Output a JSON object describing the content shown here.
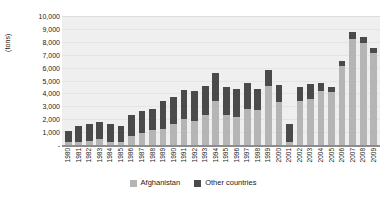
{
  "chart_data": {
    "type": "bar",
    "stacked": true,
    "title": "",
    "subtitle": "",
    "xlabel": "",
    "ylabel": "(tons)",
    "ylim": [
      0,
      10000
    ],
    "ytick_labels": [
      "-",
      "1,000",
      "2,000",
      "3,000",
      "4,000",
      "5,000",
      "6,000",
      "7,000",
      "8,000",
      "9,000",
      "10,000"
    ],
    "ytick_values": [
      0,
      1000,
      2000,
      3000,
      4000,
      5000,
      6000,
      7000,
      8000,
      9000,
      10000
    ],
    "grid": true,
    "legend_position": "bottom",
    "categories": [
      "1980",
      "1981",
      "1982",
      "1983",
      "1984",
      "1985",
      "1986",
      "1987",
      "1988",
      "1989",
      "1990",
      "1991",
      "1992",
      "1993",
      "1994",
      "1995",
      "1996",
      "1997",
      "1998",
      "1999",
      "2000",
      "2001",
      "2002",
      "2003",
      "2004",
      "2005",
      "2006",
      "2007",
      "2008",
      "2009"
    ],
    "series": [
      {
        "name": "Afghanistan",
        "color": "#b5b5b5",
        "values": [
          200,
          200,
          300,
          500,
          250,
          200,
          700,
          900,
          1200,
          1250,
          1600,
          2000,
          1900,
          2300,
          3400,
          2300,
          2200,
          2800,
          2700,
          4600,
          3300,
          200,
          3400,
          3600,
          4200,
          4100,
          6100,
          8200,
          7900,
          7100
        ]
      },
      {
        "name": "Other countries",
        "color": "#4a4a4a",
        "values": [
          850,
          1300,
          1300,
          1250,
          1350,
          1300,
          1600,
          1700,
          1600,
          2150,
          2150,
          2300,
          2250,
          2300,
          2200,
          2200,
          2150,
          2000,
          1650,
          1200,
          1350,
          1400,
          1100,
          1100,
          600,
          400,
          400,
          600,
          500,
          400
        ]
      }
    ],
    "totals": [
      1050,
      1500,
      1600,
      1750,
      1600,
      1500,
      2300,
      2600,
      2800,
      3400,
      3750,
      4300,
      4150,
      4600,
      5600,
      4500,
      4350,
      4800,
      4350,
      5800,
      4650,
      1600,
      4500,
      4700,
      4800,
      4500,
      6500,
      8800,
      8400,
      7500
    ]
  },
  "legend": {
    "items": [
      {
        "label": "Afghanistan",
        "color": "#b5b5b5"
      },
      {
        "label": "Other countries",
        "color": "#4a4a4a"
      }
    ]
  },
  "axis": {
    "y_title": "(tons)"
  }
}
